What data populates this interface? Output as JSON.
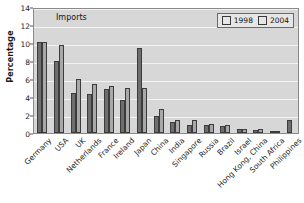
{
  "chart_data": {
    "type": "bar",
    "title": "Imports",
    "xlabel": "",
    "ylabel": "Percentage",
    "ylim": [
      0,
      14
    ],
    "yticks": [
      0,
      2,
      4,
      6,
      8,
      10,
      12,
      14
    ],
    "grid": true,
    "legend_position": "top-right",
    "categories": [
      "Germany",
      "USA",
      "UK",
      "Netherlands",
      "France",
      "Ireland",
      "Japan",
      "China",
      "India",
      "Singapore",
      "Russia",
      "Brazil",
      "Israel",
      "Hong Kong, China",
      "South Africa",
      "Philippines"
    ],
    "series": [
      {
        "name": "1998",
        "color": "#6e6e6e",
        "values": [
          10.1,
          8.0,
          4.5,
          4.3,
          4.9,
          3.65,
          9.5,
          1.9,
          1.2,
          0.9,
          0.9,
          0.8,
          0.4,
          0.35,
          0.1,
          1.4
        ]
      },
      {
        "name": "2004",
        "color": "#a8a8a8",
        "values": [
          10.1,
          9.8,
          6.0,
          5.45,
          5.2,
          5.0,
          5.0,
          2.7,
          1.5,
          1.45,
          0.95,
          0.85,
          0.5,
          0.5,
          0.1,
          0.0
        ]
      }
    ]
  },
  "legend": {
    "items": [
      {
        "label": "1998"
      },
      {
        "label": "2004"
      }
    ]
  },
  "colors": {
    "plot_background": "#d7d7d7",
    "gridline": "#f2f2f2",
    "series_1998": "#6e6e6e",
    "series_2004": "#a8a8a8",
    "axis": "#8a8a8a",
    "text": "#1c1c1c"
  }
}
